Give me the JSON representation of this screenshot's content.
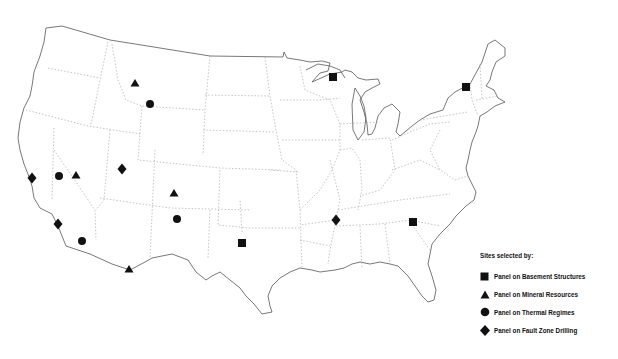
{
  "map": {
    "title": "Sites selected by panels",
    "region": "Contiguous United States",
    "marker_color": "#111111",
    "sites": [
      {
        "panel": "fault",
        "shape": "diamond",
        "x": 32,
        "y": 178
      },
      {
        "panel": "thermal",
        "shape": "circle",
        "x": 59,
        "y": 176
      },
      {
        "panel": "mineral",
        "shape": "triangle",
        "x": 76,
        "y": 175
      },
      {
        "panel": "fault",
        "shape": "diamond",
        "x": 122,
        "y": 169
      },
      {
        "panel": "fault",
        "shape": "diamond",
        "x": 58,
        "y": 224
      },
      {
        "panel": "thermal",
        "shape": "circle",
        "x": 82,
        "y": 241
      },
      {
        "panel": "mineral",
        "shape": "triangle",
        "x": 129,
        "y": 269
      },
      {
        "panel": "mineral",
        "shape": "triangle",
        "x": 135,
        "y": 83
      },
      {
        "panel": "thermal",
        "shape": "circle",
        "x": 150,
        "y": 104
      },
      {
        "panel": "mineral",
        "shape": "triangle",
        "x": 174,
        "y": 193
      },
      {
        "panel": "thermal",
        "shape": "circle",
        "x": 177,
        "y": 219
      },
      {
        "panel": "basement",
        "shape": "square",
        "x": 242,
        "y": 243
      },
      {
        "panel": "fault",
        "shape": "diamond",
        "x": 336,
        "y": 220
      },
      {
        "panel": "basement",
        "shape": "square",
        "x": 413,
        "y": 222
      },
      {
        "panel": "basement",
        "shape": "square",
        "x": 333,
        "y": 77
      },
      {
        "panel": "basement",
        "shape": "square",
        "x": 466,
        "y": 87
      }
    ]
  },
  "legend": {
    "title": "Sites selected by:",
    "items": [
      {
        "icon": "square-icon",
        "label": "Panel on Basement Structures"
      },
      {
        "icon": "triangle-icon",
        "label": "Panel on Mineral Resources"
      },
      {
        "icon": "circle-icon",
        "label": "Panel on Thermal Regimes"
      },
      {
        "icon": "diamond-icon",
        "label": "Panel on Fault Zone Drilling"
      }
    ]
  }
}
